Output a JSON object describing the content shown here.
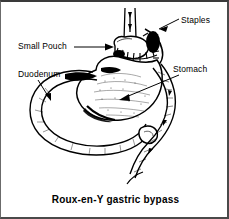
{
  "figure": {
    "caption": "Roux-en-Y gastric bypass",
    "style": {
      "ink": "#000000",
      "paper": "#ffffff",
      "border": "#4a4a4a",
      "backdrop": "#8a8a8a"
    },
    "labels": [
      {
        "id": "staples",
        "text": "Staples",
        "leader": "line-down-left-to-arrow"
      },
      {
        "id": "small-pouch",
        "text": "Small Pouch",
        "leader": "horizontal-arrow-right"
      },
      {
        "id": "duodenum",
        "text": "Duodenum",
        "leader": "diagonal-arrow-down-right"
      },
      {
        "id": "stomach",
        "text": "Stomach",
        "leader": "long-arrow-down-left"
      }
    ],
    "anatomy": [
      "esophagus",
      "gastric-pouch",
      "staple-line",
      "stomach-remnant",
      "duodenum-loop",
      "roux-limb",
      "jejunojejunostomy"
    ]
  }
}
